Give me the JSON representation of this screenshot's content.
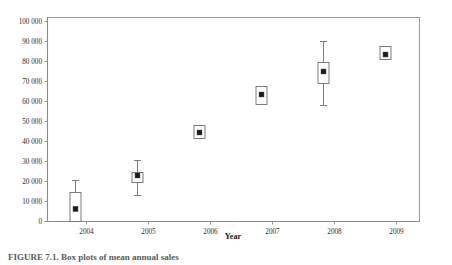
{
  "chart_data": {
    "type": "box",
    "title": "",
    "xlabel": "Year",
    "ylabel": "",
    "categories": [
      "2004",
      "2005",
      "2006",
      "2007",
      "2008",
      "2009"
    ],
    "x_tick_labels": [
      "2004",
      "2005",
      "2006",
      "2007",
      "2008",
      "2009"
    ],
    "y_tick_labels": [
      "0",
      "10 000",
      "20 000",
      "30 000",
      "40 000",
      "50 000",
      "60 000",
      "70 000",
      "80 000",
      "90 000",
      "100 000"
    ],
    "y_tick_values": [
      0,
      10000,
      20000,
      30000,
      40000,
      50000,
      60000,
      70000,
      80000,
      90000,
      100000
    ],
    "ylim": [
      0,
      100000
    ],
    "grid": false,
    "legend": false,
    "box_color": "#ffffff",
    "line_color": "#6e6e6e",
    "marker_color": "#1a1a1a",
    "frame_color": "#9a9a9a",
    "boxes": [
      {
        "category": "2004",
        "whisker_low": 0,
        "box_low": 0,
        "mean": 6300,
        "box_high": 14500,
        "whisker_high": 20500
      },
      {
        "category": "2005",
        "whisker_low": 13000,
        "box_low": 19500,
        "mean": 23000,
        "box_high": 24500,
        "whisker_high": 30500
      },
      {
        "category": "2006",
        "whisker_low": 41500,
        "box_low": 41500,
        "mean": 44500,
        "box_high": 48000,
        "whisker_high": 48000
      },
      {
        "category": "2007",
        "whisker_low": 58500,
        "box_low": 58500,
        "mean": 63500,
        "box_high": 67500,
        "whisker_high": 67500
      },
      {
        "category": "2008",
        "whisker_low": 58000,
        "box_low": 69000,
        "mean": 75000,
        "box_high": 79500,
        "whisker_high": 90000
      },
      {
        "category": "2009",
        "whisker_low": 81000,
        "box_low": 81000,
        "mean": 83500,
        "box_high": 87500,
        "whisker_high": 87500
      }
    ]
  },
  "caption": {
    "text": "FIGURE 7.1. Box plots of mean annual sales"
  }
}
